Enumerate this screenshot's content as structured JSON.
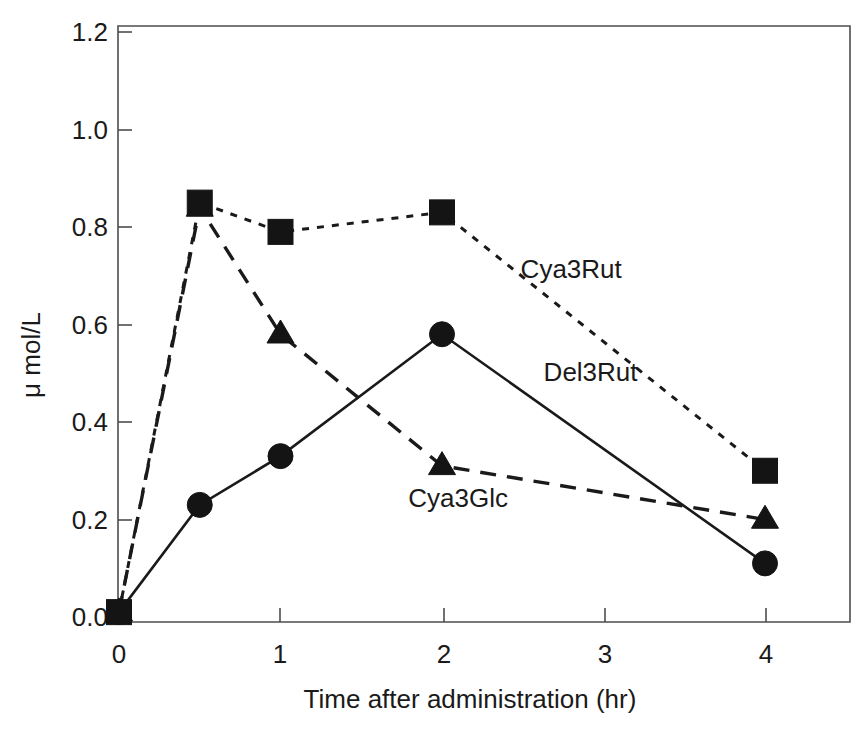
{
  "chart_data": {
    "type": "line",
    "title": "",
    "xlabel": "Time after administration  (hr)",
    "ylabel": "μ mol/L",
    "x": [
      0,
      0.5,
      1,
      2,
      4
    ],
    "xlim": [
      0,
      4.5
    ],
    "ylim": [
      0.0,
      1.2
    ],
    "xticks": [
      "0",
      "1",
      "2",
      "3",
      "4"
    ],
    "xtick_values": [
      0,
      1,
      2,
      3,
      4
    ],
    "yticks": [
      "0.0",
      "0.2",
      "0.4",
      "0.6",
      "0.8",
      "1.0",
      "1.2"
    ],
    "ytick_values": [
      0.0,
      0.2,
      0.4,
      0.6,
      0.8,
      1.0,
      1.2
    ],
    "grid": false,
    "legend_position": "inline-annotations",
    "series": [
      {
        "name": "Cya3Rut",
        "marker": "square",
        "linestyle": "dotted",
        "values": [
          0.01,
          0.85,
          0.79,
          0.83,
          0.3
        ],
        "label_x": 2.8,
        "label_y": 0.695
      },
      {
        "name": "Cya3Glc",
        "marker": "triangle",
        "linestyle": "dashed",
        "values": [
          0.01,
          0.84,
          0.58,
          0.31,
          0.2
        ],
        "label_x": 2.1,
        "label_y": 0.225
      },
      {
        "name": "Del3Rut",
        "marker": "circle",
        "linestyle": "solid",
        "values": [
          0.01,
          0.23,
          0.33,
          0.58,
          0.11
        ],
        "label_x": 2.92,
        "label_y": 0.485
      }
    ]
  },
  "axes": {
    "y_axis_label": "μ mol/L",
    "x_axis_label": "Time after administration  (hr)",
    "x_tick_0": "0",
    "x_tick_1": "1",
    "x_tick_2": "2",
    "x_tick_3": "3",
    "x_tick_4": "4",
    "y_tick_0": "0.0",
    "y_tick_1": "0.2",
    "y_tick_2": "0.4",
    "y_tick_3": "0.6",
    "y_tick_4": "0.8",
    "y_tick_5": "1.0",
    "y_tick_6": "1.2"
  },
  "annotations": {
    "cya3rut": "Cya3Rut",
    "del3rut": "Del3Rut",
    "cya3glc": "Cya3Glc"
  },
  "colors": {
    "ink": "#1a1a1a",
    "axis": "#4d4d4d",
    "marker": "#141414",
    "background": "#ffffff"
  }
}
